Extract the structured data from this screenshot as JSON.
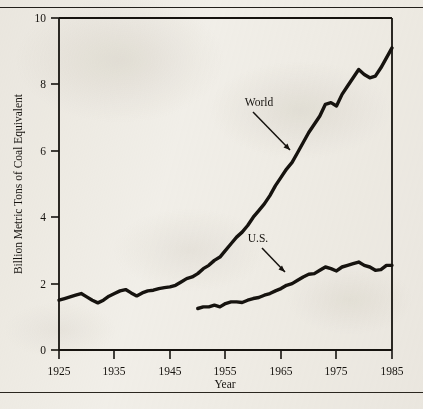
{
  "page": {
    "top_caption": "",
    "background_color": "#f3f1ec",
    "ink_color": "#16130f"
  },
  "chart_data": {
    "type": "line",
    "title": "",
    "xlabel": "Year",
    "ylabel": "Billion Metric Tons of Coal Equivalent",
    "xlim": [
      1925,
      1985
    ],
    "ylim": [
      0,
      10
    ],
    "xticks": [
      1925,
      1935,
      1945,
      1955,
      1965,
      1975,
      1985
    ],
    "xtick_labels": [
      "1925",
      "1935",
      "1945",
      "1955",
      "1965",
      "1975",
      "1985"
    ],
    "yticks": [
      0,
      2,
      4,
      6,
      8,
      10
    ],
    "ytick_labels": [
      "0",
      "2",
      "4",
      "6",
      "8",
      "10"
    ],
    "grid": false,
    "legend_position": "inline-annotations",
    "annotations": [
      {
        "text": "World",
        "x": 1963,
        "y": 6.9
      },
      {
        "text": "U.S.",
        "x": 1963,
        "y": 2.85
      }
    ],
    "series": [
      {
        "name": "World",
        "label": "World",
        "color": "#16130f",
        "x": [
          1925,
          1926,
          1927,
          1928,
          1929,
          1930,
          1931,
          1932,
          1933,
          1934,
          1935,
          1936,
          1937,
          1938,
          1939,
          1940,
          1941,
          1942,
          1943,
          1944,
          1945,
          1946,
          1947,
          1948,
          1949,
          1950,
          1951,
          1952,
          1953,
          1954,
          1955,
          1956,
          1957,
          1958,
          1959,
          1960,
          1961,
          1962,
          1963,
          1964,
          1965,
          1966,
          1967,
          1968,
          1969,
          1970,
          1971,
          1972,
          1973,
          1974,
          1975,
          1976,
          1977,
          1978,
          1979,
          1980,
          1981,
          1982,
          1983,
          1984,
          1985
        ],
        "y": [
          1.5,
          1.55,
          1.6,
          1.65,
          1.7,
          1.6,
          1.5,
          1.42,
          1.5,
          1.62,
          1.7,
          1.78,
          1.82,
          1.72,
          1.63,
          1.72,
          1.78,
          1.8,
          1.85,
          1.88,
          1.9,
          1.95,
          2.05,
          2.15,
          2.2,
          2.3,
          2.45,
          2.55,
          2.7,
          2.8,
          3.0,
          3.2,
          3.4,
          3.55,
          3.75,
          4.0,
          4.2,
          4.4,
          4.65,
          4.95,
          5.2,
          5.45,
          5.65,
          5.95,
          6.25,
          6.55,
          6.8,
          7.05,
          7.4,
          7.45,
          7.35,
          7.7,
          7.95,
          8.2,
          8.45,
          8.3,
          8.2,
          8.25,
          8.5,
          8.8,
          9.1
        ]
      },
      {
        "name": "U.S.",
        "label": "U.S.",
        "color": "#16130f",
        "x": [
          1950,
          1951,
          1952,
          1953,
          1954,
          1955,
          1956,
          1957,
          1958,
          1959,
          1960,
          1961,
          1962,
          1963,
          1964,
          1965,
          1966,
          1967,
          1968,
          1969,
          1970,
          1971,
          1972,
          1973,
          1974,
          1975,
          1976,
          1977,
          1978,
          1979,
          1980,
          1981,
          1982,
          1983,
          1984,
          1985
        ],
        "y": [
          1.25,
          1.3,
          1.3,
          1.35,
          1.3,
          1.4,
          1.45,
          1.45,
          1.43,
          1.5,
          1.55,
          1.58,
          1.65,
          1.7,
          1.78,
          1.85,
          1.95,
          2.0,
          2.1,
          2.2,
          2.28,
          2.3,
          2.4,
          2.5,
          2.45,
          2.38,
          2.5,
          2.55,
          2.6,
          2.65,
          2.55,
          2.5,
          2.4,
          2.42,
          2.55,
          2.55
        ]
      }
    ]
  }
}
